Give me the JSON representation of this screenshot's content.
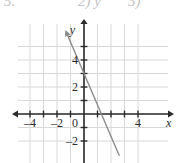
{
  "page": {
    "top_text_fragments": [
      "5.",
      "2) y",
      "3)"
    ]
  },
  "chart_data": {
    "type": "line",
    "title": "",
    "xlabel": "x",
    "ylabel": "y",
    "xlim": [
      -5.2,
      4.9
    ],
    "ylim": [
      -2.9,
      5.6
    ],
    "grid": true,
    "grid_step": 1,
    "legend": null,
    "x_ticks": [
      -4,
      -2,
      0,
      4
    ],
    "x_tick_labels": [
      "–4",
      "–2",
      "0",
      "4"
    ],
    "x_tick_marks": [
      -5,
      -4,
      -3,
      -2,
      -1,
      1,
      2,
      3,
      4
    ],
    "y_ticks": [
      4,
      2,
      -2
    ],
    "y_tick_labels": [
      "4",
      "2",
      "–2"
    ],
    "y_tick_marks": [
      5,
      4,
      3,
      2,
      1,
      -1,
      -2
    ],
    "series": [
      {
        "name": "line",
        "slope": -2.33,
        "intercept": 3,
        "x": [
          -1,
          2.6
        ],
        "y": [
          5.33,
          -3.06
        ],
        "color": "#8c8c8c",
        "arrow_start": true,
        "arrow_end": false
      }
    ],
    "colors": {
      "grid": "#d8d8d8",
      "axis": "#2b2b2b",
      "line": "#8c8c8c",
      "background": "#ffffff"
    },
    "annotations": []
  }
}
